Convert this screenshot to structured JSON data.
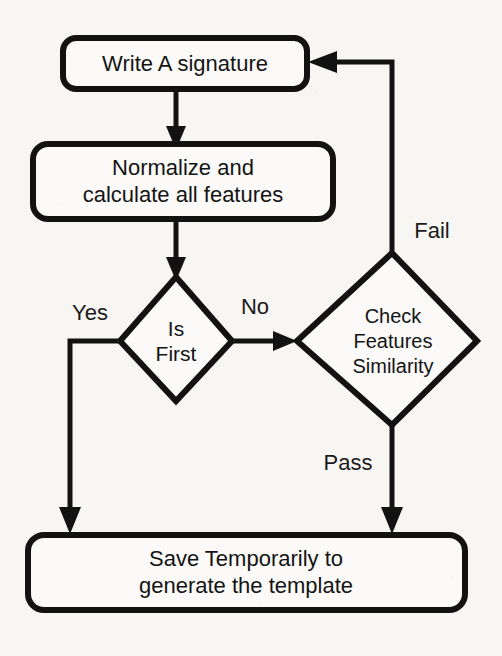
{
  "diagram": {
    "background_color": "#f7f6f3",
    "line_color": "#121212",
    "text_color": "#141414",
    "nodes": [
      {
        "id": "write-signature",
        "shape": "rounded-rectangle",
        "lines": [
          "Write A signature"
        ]
      },
      {
        "id": "normalize-features",
        "shape": "rounded-rectangle",
        "lines": [
          "Normalize and",
          "calculate all features"
        ]
      },
      {
        "id": "is-first",
        "shape": "diamond",
        "lines": [
          "Is",
          "First"
        ]
      },
      {
        "id": "check-features-similarity",
        "shape": "diamond",
        "lines": [
          "Check",
          "Features",
          "Similarity"
        ]
      },
      {
        "id": "save-template",
        "shape": "rounded-rectangle",
        "lines": [
          "Save Temporarily to",
          "generate the template"
        ]
      }
    ],
    "edge_labels": {
      "yes": "Yes",
      "no": "No",
      "fail": "Fail",
      "pass": "Pass"
    }
  }
}
